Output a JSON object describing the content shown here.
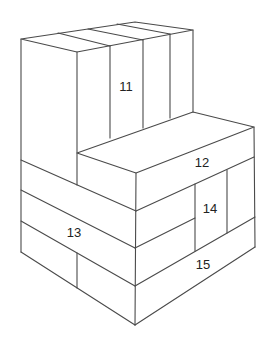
{
  "diagram": {
    "type": "isometric block stack",
    "stroke_color": "#4a4a4a",
    "background": "#ffffff",
    "labels": [
      {
        "id": "block-11",
        "text": "11",
        "x": 126,
        "y": 88
      },
      {
        "id": "block-12",
        "text": "12",
        "x": 202,
        "y": 164
      },
      {
        "id": "block-13",
        "text": "13",
        "x": 74,
        "y": 234
      },
      {
        "id": "block-14",
        "text": "14",
        "x": 210,
        "y": 210
      },
      {
        "id": "block-15",
        "text": "15",
        "x": 203,
        "y": 266
      }
    ]
  }
}
